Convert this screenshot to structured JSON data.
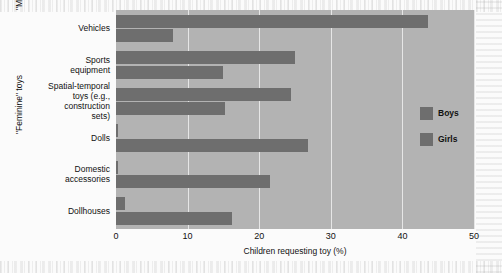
{
  "chart_data": {
    "type": "bar",
    "orientation": "horizontal",
    "title": "",
    "xlabel": "Children requesting toy (%)",
    "ylabel": "",
    "xlim": [
      0,
      50
    ],
    "xticks": [
      0,
      10,
      20,
      30,
      40,
      50
    ],
    "grid": true,
    "legend_position": "right",
    "categories": [
      "Vehicles",
      "Sports equipment",
      "Spatial-temporal toys (e.g., construction sets)",
      "Dolls",
      "Domestic accessories",
      "Dollhouses"
    ],
    "series": [
      {
        "name": "Boys",
        "values": [
          43.6,
          25.0,
          24.5,
          0.3,
          0.3,
          1.2
        ]
      },
      {
        "name": "Girls",
        "values": [
          8.0,
          15.0,
          15.2,
          26.8,
          21.5,
          16.2
        ]
      }
    ],
    "groups": [
      {
        "label": "\"Masculine\" toys",
        "categories": [
          "Vehicles",
          "Sports equipment",
          "Spatial-temporal toys (e.g., construction sets)"
        ]
      },
      {
        "label": "\"Feminine\" toys",
        "categories": [
          "Dolls",
          "Domestic accessories",
          "Dollhouses"
        ]
      }
    ],
    "colors": {
      "bar": "#6e6e6e",
      "plot_background": "#b3b3b3",
      "gridline": "#e6e6e6",
      "figure_background": "#fbfbfb",
      "text": "#111111"
    }
  },
  "category_labels": [
    {
      "lines": [
        "Vehicles"
      ]
    },
    {
      "lines": [
        "Sports",
        "equipment"
      ]
    },
    {
      "lines": [
        "Spatial-temporal",
        "toys (e.g.,",
        "construction",
        "sets)"
      ]
    },
    {
      "lines": [
        "Dolls"
      ]
    },
    {
      "lines": [
        "Domestic",
        "accessories"
      ]
    },
    {
      "lines": [
        "Dollhouses"
      ]
    }
  ],
  "group_labels": {
    "masculine": "\"Masculine\" toys",
    "feminine": "\"Feminine\" toys"
  },
  "axis": {
    "x_title": "Children requesting toy (%)",
    "x_tick_labels": [
      "0",
      "10",
      "20",
      "30",
      "40",
      "50"
    ]
  },
  "legend": {
    "entries": [
      {
        "label": "Boys"
      },
      {
        "label": "Girls"
      }
    ]
  }
}
